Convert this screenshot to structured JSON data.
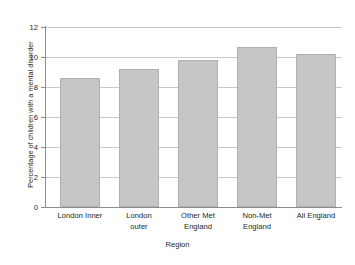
{
  "chart_data": {
    "type": "bar",
    "title": "",
    "subtitle": "",
    "xlabel": "Region",
    "ylabel": "Percentage of children with a mental disorder",
    "categories": [
      "London Inner",
      "London outer",
      "Other Met England",
      "Non-Met England",
      "All England"
    ],
    "category_lines": [
      [
        "London Inner"
      ],
      [
        "London",
        "outer"
      ],
      [
        "Other Met",
        "England"
      ],
      [
        "Non-Met",
        "England"
      ],
      [
        "All England"
      ]
    ],
    "values": [
      8.6,
      9.2,
      9.8,
      10.7,
      10.2
    ],
    "ylim": [
      0,
      12
    ],
    "ytick_labels": [
      "0",
      "2",
      "4",
      "6",
      "8",
      "10",
      "12"
    ],
    "ytick_values": [
      0,
      2,
      4,
      6,
      8,
      10,
      12
    ],
    "grid": "horizontal",
    "legend": "none",
    "bar_color": "#c6c6c6",
    "bar_edge_color": "#b0b0b0",
    "axis_color": "#8d8d8d",
    "gridline_color": "#c9c9c9",
    "text_color": "#231f20",
    "background_color": "#ffffff"
  }
}
